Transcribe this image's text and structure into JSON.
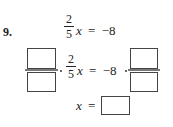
{
  "problem": {
    "number": "9.",
    "line1": {
      "coef_num": "2",
      "coef_den": "5",
      "var": "x",
      "eq": "=",
      "rhs": "−8"
    },
    "line2": {
      "coef_num": "2",
      "coef_den": "5",
      "var": "x",
      "eq": "=",
      "rhs": "−8",
      "left_box_numerator": "",
      "left_box_denominator": "",
      "right_box_numerator": "",
      "right_box_denominator": ""
    },
    "line3": {
      "var": "x",
      "eq": "=",
      "answer": ""
    }
  }
}
